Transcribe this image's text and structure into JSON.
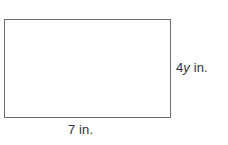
{
  "figure": {
    "name": "rectangle-diagram",
    "shape": "rectangle",
    "background_color": "#ffffff",
    "stroke_color": "#6e6e6e",
    "fill_color": "#ffffff",
    "text_color": "#333333"
  },
  "labels": {
    "height": {
      "full_text": "4y in.",
      "coefficient": "4",
      "variable": "y",
      "unit": "in.",
      "position": "right"
    },
    "width": {
      "full_text": "7 in.",
      "value": "7",
      "unit": "in.",
      "position": "bottom"
    }
  }
}
